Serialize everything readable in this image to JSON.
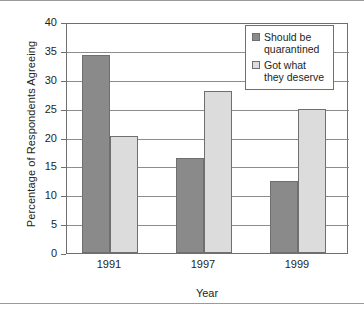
{
  "chart_data": {
    "type": "bar",
    "title": "",
    "xlabel": "Year",
    "ylabel": "Percentage of Respondents Agreeing",
    "categories": [
      "1991",
      "1997",
      "1999"
    ],
    "series": [
      {
        "name": "Should be quarantined",
        "color": "#8a8a8a",
        "values": [
          34.3,
          16.5,
          12.4
        ]
      },
      {
        "name": "Got what they deserve",
        "color": "#dcdcdc",
        "values": [
          20.3,
          28.1,
          25.0
        ]
      }
    ],
    "ylim": [
      0,
      40
    ],
    "yticks": [
      0,
      5,
      10,
      15,
      20,
      25,
      30,
      35,
      40
    ],
    "ytick_labels": [
      "0",
      "5",
      "10",
      "15",
      "20",
      "25",
      "30",
      "35",
      "40"
    ],
    "grid": true,
    "legend_position": "top-right"
  },
  "legend": {
    "entries": [
      {
        "label_line1": "Should be",
        "label_line2": "quarantined"
      },
      {
        "label_line1": "Got what",
        "label_line2": "they deserve"
      }
    ]
  }
}
